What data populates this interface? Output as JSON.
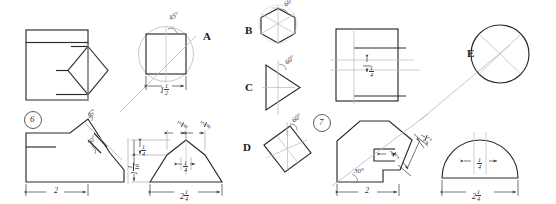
{
  "sheet": {
    "title": "Engineering drawing exercise sheet",
    "background": "#ffffff",
    "line_color": "#2a2a2a",
    "construction_color": "#b9b9b9",
    "width": 556,
    "height": 204
  },
  "problems": [
    {
      "id": "problem-6",
      "number": "6"
    },
    {
      "id": "problem-7",
      "number": "7"
    }
  ],
  "section_labels": [
    {
      "key": "A",
      "label": "A",
      "shape": "square-in-circle"
    },
    {
      "key": "B",
      "label": "B",
      "shape": "hexagon"
    },
    {
      "key": "C",
      "label": "C",
      "shape": "triangle"
    },
    {
      "key": "D",
      "label": "D",
      "shape": "tilted-square"
    },
    {
      "key": "E",
      "label": "E",
      "shape": "circle"
    }
  ],
  "angles": {
    "a45_top": "45°",
    "a45_left": "45°",
    "b60": "60°",
    "c60": "60°",
    "d60": "60°",
    "p6_30": "30°",
    "p7_30": "30°"
  },
  "dimensions": {
    "a_width_whole": "1",
    "a_width_num": "1",
    "a_width_den": "2",
    "p6_base": "2",
    "p7_base": "2",
    "bot_center_base_whole": "2",
    "bot_center_base_num": "1",
    "bot_center_base_den": "4",
    "bot_right_base_whole": "2",
    "bot_right_base_num": "1",
    "bot_right_base_den": "4",
    "top_left_num": "5",
    "top_left_den": "8",
    "top_right_num": "5",
    "top_right_den": "8",
    "center_notch_num": "1",
    "center_notch_den": "4",
    "semi_notch_num": "1",
    "semi_notch_den": "4",
    "vert_small_num": "1",
    "vert_small_den": "4",
    "vert_tall_whole": "1",
    "vert_tall_num": "1",
    "vert_tall_den": "16",
    "p7_depth_whole": "2",
    "p7_depth_num": "1",
    "p7_depth_den": "2",
    "p7_small_num": "1",
    "p7_small_den": "2",
    "top_rect_gap_num": "1",
    "top_rect_gap_den": "4"
  }
}
